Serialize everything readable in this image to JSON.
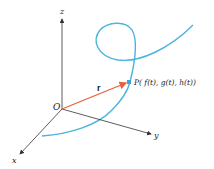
{
  "figure": {
    "axes": {
      "z_label": "z",
      "y_label": "y",
      "x_label": "x",
      "origin_label": "O"
    },
    "vector": {
      "label": "r",
      "color": "#e8623a"
    },
    "point": {
      "label": "P( f(t), g(t), h(t))",
      "color": "#3aa7d6"
    },
    "curve": {
      "color": "#4ab4dc"
    },
    "axis_color": "#333333"
  }
}
